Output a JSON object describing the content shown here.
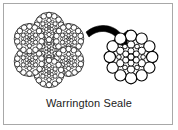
{
  "figure": {
    "caption": "Warrington Seale",
    "frame_color": "#a8a8a8",
    "background_color": "#ffffff",
    "wire_outline_color": "#000000",
    "wire_fill_color": "#ffffff",
    "arrow_color": "#000000"
  },
  "diagram": {
    "title": "Warrington Seale",
    "type": "wire-rope-cross-section",
    "left_figure_label": "rope-cross-section",
    "right_figure_label": "single-strand-detail",
    "arrow_label": "magnify-arrow",
    "rope": {
      "strand_count": 7,
      "outer_strand_count": 6,
      "core_strand_count": 1,
      "center_x": 49,
      "center_y": 50,
      "strand_radius": 15.5,
      "ring_radius": 22
    },
    "strand": {
      "center_x": 131,
      "center_y": 57,
      "outer_radius": 27,
      "layers": [
        {
          "name": "outer-seale-layer",
          "count": 12,
          "wire_radius": 5.6,
          "orbit": 21.2
        },
        {
          "name": "warrington-layer-large",
          "count": 6,
          "wire_radius": 3.6,
          "orbit": 12.6
        },
        {
          "name": "warrington-layer-small",
          "count": 6,
          "wire_radius": 2.3,
          "orbit": 12.1
        },
        {
          "name": "inner-layer",
          "count": 6,
          "wire_radius": 3.0,
          "orbit": 6.0
        },
        {
          "name": "core-wire",
          "count": 1,
          "wire_radius": 3.0,
          "orbit": 0
        }
      ]
    }
  }
}
